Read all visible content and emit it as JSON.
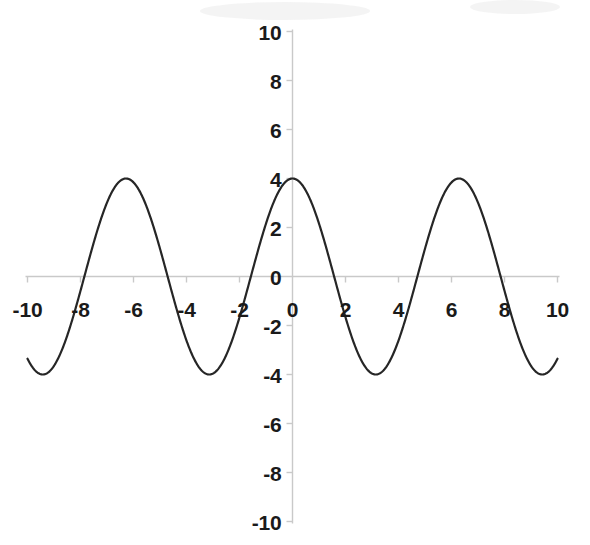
{
  "chart_data": {
    "type": "line",
    "title": "",
    "subtitle": "",
    "xlabel": "",
    "ylabel": "",
    "xlim": [
      -10,
      10
    ],
    "ylim": [
      -10,
      10
    ],
    "grid": false,
    "legend": null,
    "legend_position": "none",
    "x_ticks": [
      -10,
      -8,
      -6,
      -4,
      -2,
      0,
      2,
      4,
      6,
      8,
      10
    ],
    "x_tick_labels": [
      "-10",
      "-8",
      "-6",
      "-4",
      "-2",
      "0",
      "2",
      "4",
      "6",
      "8",
      "10"
    ],
    "y_ticks": [
      -10,
      -8,
      -6,
      -4,
      -2,
      0,
      2,
      4,
      6,
      8,
      10
    ],
    "y_tick_labels": [
      "-10",
      "-8",
      "-6",
      "-4",
      "-2",
      "0",
      "2",
      "4",
      "6",
      "8",
      "10"
    ],
    "y_tick_labels_shown": [
      "10",
      "8",
      "6",
      "4",
      "2",
      "0",
      "-2",
      "-4",
      "-6",
      "-8",
      "-10"
    ],
    "series": [
      {
        "name": "y = 4 cos(x)",
        "amplitude": 4,
        "period": 6.283,
        "function": "4*cos(x)",
        "color": "#262626",
        "line_width": 2.2,
        "x": [
          -10,
          -9.5,
          -9,
          -8.5,
          -8,
          -7.5,
          -7,
          -6.5,
          -6,
          -5.5,
          -5,
          -4.5,
          -4,
          -3.5,
          -3,
          -2.5,
          -2,
          -1.5,
          -1,
          -0.5,
          0,
          0.5,
          1,
          1.5,
          2,
          2.5,
          3,
          3.5,
          4,
          4.5,
          5,
          5.5,
          6,
          6.5,
          7,
          7.5,
          8,
          8.5,
          9,
          9.5,
          10
        ],
        "y": [
          -3.36,
          -3.94,
          -3.64,
          -2.69,
          -1.16,
          0.69,
          2.46,
          3.76,
          3.84,
          2.83,
          1.13,
          -0.84,
          -2.61,
          -3.75,
          -3.96,
          -3.2,
          -1.66,
          0.28,
          2.16,
          3.51,
          4,
          3.51,
          2.16,
          0.28,
          -1.66,
          -3.2,
          -3.96,
          -3.75,
          -2.61,
          -0.84,
          1.13,
          2.83,
          3.84,
          3.76,
          2.46,
          0.69,
          -1.16,
          -2.69,
          -3.64,
          -3.94,
          -3.36
        ]
      }
    ],
    "maxima": [
      {
        "x": -6.283,
        "y": 4
      },
      {
        "x": 0,
        "y": 4
      },
      {
        "x": 6.283,
        "y": 4
      }
    ],
    "minima": [
      {
        "x": -9.425,
        "y": -4
      },
      {
        "x": -3.142,
        "y": -4
      },
      {
        "x": 3.142,
        "y": -4
      },
      {
        "x": 9.425,
        "y": -4
      }
    ],
    "zero_crossings": [
      -7.854,
      -4.712,
      -1.571,
      1.571,
      4.712,
      7.854
    ],
    "axis_color": "#c9c9c9",
    "tick_color": "#c9c9c9",
    "label_color": "#1a1a1a",
    "background_color": "#ffffff"
  },
  "axes": {
    "x_axis_name": "x-axis",
    "y_axis_name": "y-axis"
  }
}
